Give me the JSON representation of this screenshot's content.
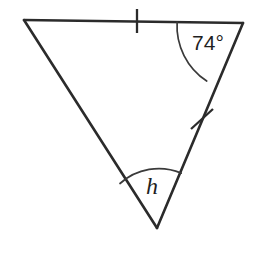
{
  "figure": {
    "name": "triangle-with-angle-measures",
    "background_color": "#ffffff",
    "stroke_color": "#2b2b2b",
    "arc_color": "#3a3a3a",
    "label_color": "#1f1f1f"
  },
  "vertices": {
    "top_left": {
      "name": "A",
      "x": 24,
      "y": 20
    },
    "top_right": {
      "name": "B",
      "x": 243,
      "y": 23
    },
    "bottom": {
      "name": "C",
      "x": 157,
      "y": 228
    }
  },
  "sides": [
    {
      "name": "top-side",
      "from": "top_left",
      "to": "top_right",
      "tick_count": 1
    },
    {
      "name": "right-side",
      "from": "top_right",
      "to": "bottom",
      "tick_count": 1
    },
    {
      "name": "left-side",
      "from": "top_left",
      "to": "bottom",
      "tick_count": 0
    }
  ],
  "tick_marks": [
    {
      "name": "tick-top-side",
      "x": 137,
      "y": 21,
      "angle_deg": 0.8,
      "length": 24
    },
    {
      "name": "tick-right-side",
      "x": 202,
      "y": 119,
      "angle_deg": 67.3,
      "length": 24
    }
  ],
  "angles": [
    {
      "name": "angle-top-right",
      "label": "74°",
      "value": 74,
      "unit": "degrees",
      "vertex": "top_right",
      "arc_radius": 66,
      "label_x": 208,
      "label_y": 44
    },
    {
      "name": "angle-bottom",
      "label": "h",
      "value": null,
      "unit": "unknown-variable",
      "vertex": "bottom",
      "arc_radius": 58,
      "label_x": 152,
      "label_y": 188
    }
  ]
}
